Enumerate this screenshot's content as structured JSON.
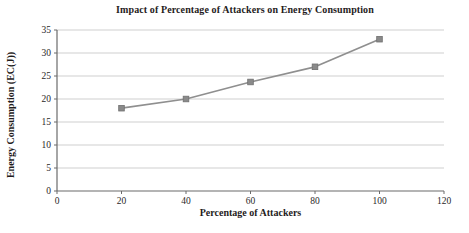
{
  "chart_data": {
    "type": "line",
    "title": "Impact of Percentage of Attackers on Energy Consumption",
    "xlabel": "Percentage of Attackers",
    "ylabel": "Energy Consumption (EC(J))",
    "series": [
      {
        "name": "Energy Consumption",
        "x": [
          20,
          40,
          60,
          80,
          100
        ],
        "values": [
          18,
          20,
          23.7,
          27,
          33
        ]
      }
    ],
    "xlim": [
      0,
      120
    ],
    "ylim": [
      0,
      35
    ],
    "x_ticks": [
      0,
      20,
      40,
      60,
      80,
      100,
      120
    ],
    "y_ticks": [
      0,
      5,
      10,
      15,
      20,
      25,
      30,
      35
    ],
    "grid": "horizontal",
    "legend_position": "none",
    "marker": "square",
    "colors": {
      "series": "#8f8f8f",
      "marker_fill": "#8a8a8a",
      "marker_edge": "#707070",
      "gridline": "#cfcfcf",
      "axis": "#6b6b6b",
      "tick_text": "#2a2727"
    }
  }
}
